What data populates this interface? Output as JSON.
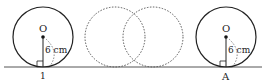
{
  "diagram": {
    "colors": {
      "stroke": "#222222",
      "dashed": "#555555",
      "ground": "#444444"
    },
    "left_circle": {
      "center_label": "O",
      "radius_label": "6 cm",
      "contact_label": "1"
    },
    "ghost_circles": {
      "count": 2,
      "style": "dashed"
    },
    "right_circle": {
      "center_label": "O",
      "radius_label": "6 cm",
      "contact_label": "A"
    }
  }
}
